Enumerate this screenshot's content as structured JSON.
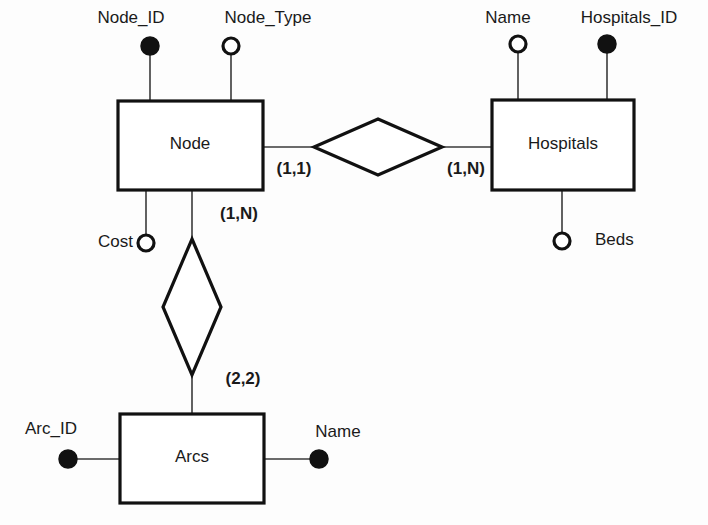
{
  "diagram": {
    "kind": "entity-relationship-diagram",
    "notation": "min-max cardinality",
    "background_color": "#fdfdfd",
    "line_color": "#111111"
  },
  "entities": [
    {
      "id": "node",
      "label": "Node",
      "x": 118,
      "y": 101,
      "w": 145,
      "h": 89,
      "label_x": 190,
      "label_y": 145
    },
    {
      "id": "hospitals",
      "label": "Hospitals",
      "x": 492,
      "y": 100,
      "w": 142,
      "h": 90,
      "label_x": 563,
      "label_y": 145
    },
    {
      "id": "arcs",
      "label": "Arcs",
      "x": 120,
      "y": 414,
      "w": 144,
      "h": 89,
      "label_x": 192,
      "label_y": 458
    }
  ],
  "relationships": [
    {
      "id": "node-hospitals",
      "label": "",
      "orientation": "horizontal",
      "cx": 378,
      "cy": 147,
      "rx": 64,
      "ry": 28
    },
    {
      "id": "node-arcs",
      "label": "",
      "orientation": "vertical",
      "cx": 192,
      "cy": 307,
      "rx": 29,
      "ry": 68
    }
  ],
  "attributes": [
    {
      "id": "node-id",
      "label": "Node_ID",
      "key": true,
      "cx": 150,
      "cy": 46,
      "r": 9,
      "label_x": 131,
      "label_y": 19,
      "anchor": "middle",
      "line": {
        "x1": 150,
        "y1": 55,
        "x2": 150,
        "y2": 101
      }
    },
    {
      "id": "node-type",
      "label": "Node_Type",
      "key": false,
      "cx": 231,
      "cy": 46,
      "r": 8,
      "label_x": 268,
      "label_y": 19,
      "anchor": "middle",
      "line": {
        "x1": 231,
        "y1": 54,
        "x2": 231,
        "y2": 101
      }
    },
    {
      "id": "node-cost",
      "label": "Cost",
      "key": false,
      "cx": 146,
      "cy": 243,
      "r": 8,
      "label_x": 133,
      "label_y": 243,
      "anchor": "end",
      "line": {
        "x1": 146,
        "y1": 190,
        "x2": 146,
        "y2": 235
      }
    },
    {
      "id": "hospitals-name",
      "label": "Name",
      "key": false,
      "cx": 518,
      "cy": 44,
      "r": 8,
      "label_x": 508,
      "label_y": 19,
      "anchor": "middle",
      "line": {
        "x1": 518,
        "y1": 52,
        "x2": 518,
        "y2": 100
      }
    },
    {
      "id": "hospitals-id",
      "label": "Hospitals_ID",
      "key": true,
      "cx": 607,
      "cy": 44,
      "r": 9,
      "label_x": 629,
      "label_y": 19,
      "anchor": "middle",
      "line": {
        "x1": 607,
        "y1": 53,
        "x2": 607,
        "y2": 100
      }
    },
    {
      "id": "hospitals-beds",
      "label": "Beds",
      "key": false,
      "cx": 562,
      "cy": 241,
      "r": 8,
      "label_x": 595,
      "label_y": 241,
      "anchor": "start",
      "line": {
        "x1": 562,
        "y1": 190,
        "x2": 562,
        "y2": 233
      }
    },
    {
      "id": "arcs-arc-id",
      "label": "Arc_ID",
      "key": true,
      "cx": 68,
      "cy": 459,
      "r": 9,
      "label_x": 51,
      "label_y": 430,
      "anchor": "middle",
      "line": {
        "x1": 77,
        "y1": 459,
        "x2": 120,
        "y2": 459
      }
    },
    {
      "id": "arcs-name",
      "label": "Name",
      "key": true,
      "cx": 319,
      "cy": 459,
      "r": 9,
      "label_x": 338,
      "label_y": 433,
      "anchor": "middle",
      "line": {
        "x1": 264,
        "y1": 459,
        "x2": 310,
        "y2": 459
      }
    }
  ],
  "connectors": [
    {
      "id": "node-to-diamond",
      "x1": 263,
      "y1": 147,
      "x2": 314,
      "y2": 147
    },
    {
      "id": "diamond-to-hospitals",
      "x1": 442,
      "y1": 147,
      "x2": 492,
      "y2": 147
    },
    {
      "id": "node-to-vdiamond",
      "x1": 192,
      "y1": 190,
      "x2": 192,
      "y2": 239
    },
    {
      "id": "vdiamond-to-arcs",
      "x1": 192,
      "y1": 375,
      "x2": 192,
      "y2": 414
    }
  ],
  "cardinalities": [
    {
      "id": "node-side",
      "label": "(1,1)",
      "x": 294,
      "y": 170
    },
    {
      "id": "hospitals-side",
      "label": "(1,N)",
      "x": 466,
      "y": 170
    },
    {
      "id": "node-arcs-top",
      "label": "(1,N)",
      "x": 239,
      "y": 215
    },
    {
      "id": "arcs-side",
      "label": "(2,2)",
      "x": 243,
      "y": 380
    }
  ]
}
